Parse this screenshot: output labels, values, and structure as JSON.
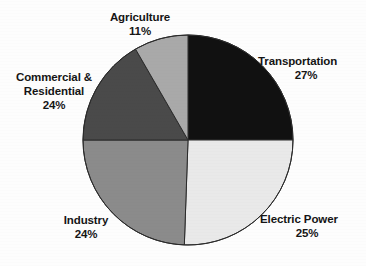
{
  "chart_data": {
    "type": "pie",
    "title": "",
    "subtitle": "",
    "xlabel": "",
    "ylabel": "",
    "legend_position": "outside-labels",
    "grid": false,
    "units": "percent",
    "categories": [
      "Transportation",
      "Electric Power",
      "Industry",
      "Commercial & Residential",
      "Agriculture"
    ],
    "values": [
      27,
      25,
      24,
      24,
      11
    ],
    "slices": [
      {
        "label": "Transportation",
        "label_lines": [
          "Transportation"
        ],
        "value": 27,
        "value_text": "27%",
        "color": "#111111",
        "start_angle_deg": 0,
        "end_angle_deg": 90
      },
      {
        "label": "Electric Power",
        "label_lines": [
          "Electric Power"
        ],
        "value": 25,
        "value_text": "25%",
        "color": "#e9e9e9",
        "start_angle_deg": 90,
        "end_angle_deg": 182
      },
      {
        "label": "Industry",
        "label_lines": [
          "Industry"
        ],
        "value": 24,
        "value_text": "24%",
        "color": "#8b8b8b",
        "start_angle_deg": 182,
        "end_angle_deg": 270
      },
      {
        "label": "Commercial & Residential",
        "label_lines": [
          "Commercial &",
          "Residential"
        ],
        "value": 24,
        "value_text": "24%",
        "color": "#4a4a4a",
        "start_angle_deg": 270,
        "end_angle_deg": 330
      },
      {
        "label": "Agriculture",
        "label_lines": [
          "Agriculture"
        ],
        "value": 11,
        "value_text": "11%",
        "color": "#a9a9a9",
        "start_angle_deg": 330,
        "end_angle_deg": 360
      }
    ],
    "labels": {
      "agriculture": {
        "name": "Agriculture",
        "pct": "11%"
      },
      "transportation": {
        "name": "Transportation",
        "pct": "27%"
      },
      "commercial_line1": "Commercial &",
      "commercial_line2": "Residential",
      "commercial_pct": "24%",
      "industry": {
        "name": "Industry",
        "pct": "24%"
      },
      "electric": {
        "name": "Electric Power",
        "pct": "25%"
      }
    }
  },
  "style": {
    "background": "#fdfdfd",
    "text_color": "#151515",
    "outline_color": "#2b2b2b"
  }
}
